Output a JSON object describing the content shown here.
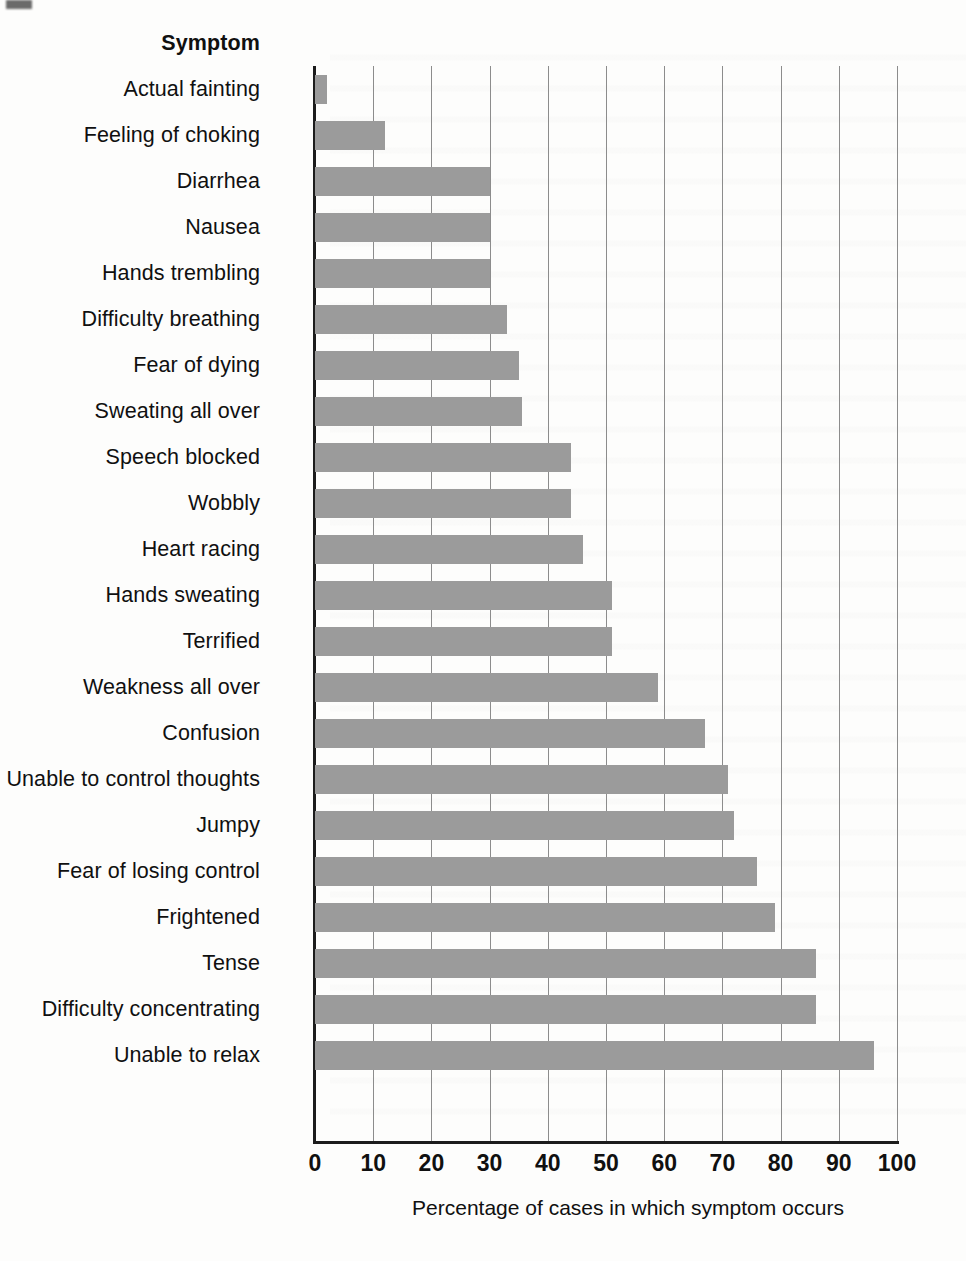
{
  "chart_data": {
    "type": "bar",
    "orientation": "horizontal",
    "title": "",
    "category_header": "Symptom",
    "xlabel": "Percentage of cases in which symptom occurs",
    "ylabel": "Symptom",
    "xlim": [
      0,
      100
    ],
    "xticks": [
      0,
      10,
      20,
      30,
      40,
      50,
      60,
      70,
      80,
      90,
      100
    ],
    "xtick_labels": [
      "0",
      "10",
      "20",
      "30",
      "40",
      "50",
      "60",
      "70",
      "80",
      "90",
      "100"
    ],
    "grid": "vertical",
    "legend": "none",
    "bar_color": "#9b9b9b",
    "axis_color": "#1c1c1c",
    "gridline_color": "#8c8c8c",
    "categories": [
      "Actual fainting",
      "Feeling of choking",
      "Diarrhea",
      "Nausea",
      "Hands trembling",
      "Difficulty breathing",
      "Fear of dying",
      "Sweating all over",
      "Speech blocked",
      "Wobbly",
      "Heart racing",
      "Hands sweating",
      "Terrified",
      "Weakness all over",
      "Confusion",
      "Unable to control thoughts",
      "Jumpy",
      "Fear of losing control",
      "Frightened",
      "Tense",
      "Difficulty concentrating",
      "Unable to relax"
    ],
    "values": [
      2,
      12,
      30,
      30,
      30,
      33,
      35,
      35.5,
      44,
      44,
      46,
      51,
      51,
      59,
      67,
      71,
      72,
      76,
      79,
      86,
      86,
      96
    ]
  }
}
